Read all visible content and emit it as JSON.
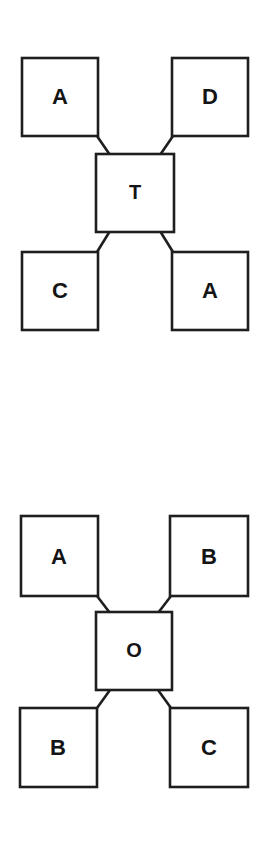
{
  "page": {
    "background_color": "#ffffff",
    "line_color": "#1e1e1e",
    "text_color": "#141414",
    "width": 270,
    "height": 842
  },
  "diagrams": [
    {
      "id": "diagram-top",
      "center": {
        "label": "T"
      },
      "nodes": [
        {
          "position": "top-left",
          "label": "A"
        },
        {
          "position": "top-right",
          "label": "D"
        },
        {
          "position": "bottom-left",
          "label": "C"
        },
        {
          "position": "bottom-right",
          "label": "A"
        }
      ]
    },
    {
      "id": "diagram-bottom",
      "center": {
        "label": "O"
      },
      "nodes": [
        {
          "position": "top-left",
          "label": "A"
        },
        {
          "position": "top-right",
          "label": "B"
        },
        {
          "position": "bottom-left",
          "label": "B"
        },
        {
          "position": "bottom-right",
          "label": "C"
        }
      ]
    }
  ]
}
